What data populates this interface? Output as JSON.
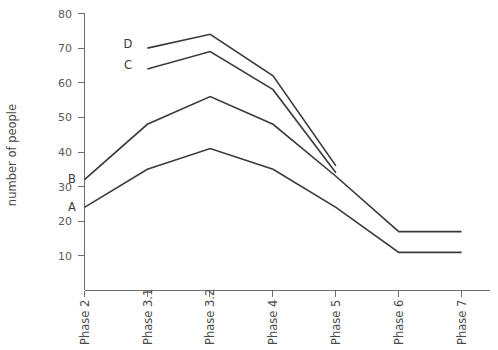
{
  "chart_data": {
    "type": "line",
    "title": "",
    "xlabel": "",
    "ylabel": "number of people",
    "categories": [
      "Phase 2",
      "Phase 3.1",
      "Phase 3.2",
      "Phase 4",
      "Phase 5",
      "Phase 6",
      "Phase 7"
    ],
    "ylim": [
      0,
      80
    ],
    "yticks": [
      10,
      20,
      30,
      40,
      50,
      60,
      70,
      80
    ],
    "grid": false,
    "legend": "inline-labels-at-line-start",
    "line_color": "#3a3a3a",
    "axis_color": "#6e6e6e",
    "series": [
      {
        "name": "A",
        "label": "A",
        "start_category": "Phase 2",
        "values": [
          24,
          35,
          41,
          35,
          24,
          11,
          11
        ]
      },
      {
        "name": "B",
        "label": "B",
        "start_category": "Phase 2",
        "values": [
          32,
          48,
          56,
          48,
          33,
          17,
          17
        ]
      },
      {
        "name": "C",
        "label": "C",
        "start_category": "Phase 3.1",
        "values": [
          null,
          64,
          69,
          58,
          34,
          null,
          null
        ]
      },
      {
        "name": "D",
        "label": "D",
        "start_category": "Phase 3.1",
        "values": [
          null,
          70,
          74,
          62,
          36,
          null,
          null
        ]
      }
    ]
  },
  "axis": {
    "y_title": "number of people",
    "y_tick_labels": [
      "80",
      "70",
      "60",
      "50",
      "40",
      "30",
      "20",
      "10"
    ],
    "x_tick_labels": [
      "Phase 2",
      "Phase 3.1",
      "Phase 3.2",
      "Phase 4",
      "Phase 5",
      "Phase 6",
      "Phase 7"
    ]
  },
  "series_labels": {
    "a": "A",
    "b": "B",
    "c": "C",
    "d": "D"
  }
}
